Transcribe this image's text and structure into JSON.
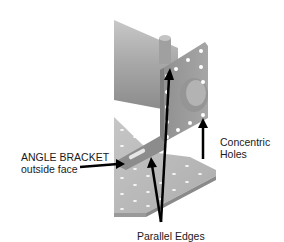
{
  "diagram": {
    "annotations": {
      "angle_bracket": {
        "line1": "ANGLE BRACKET",
        "line2": "outside face"
      },
      "concentric": {
        "line1": "Concentric",
        "line2": "Holes"
      },
      "parallel": {
        "text": "Parallel Edges"
      }
    },
    "colors": {
      "background": "#ffffff",
      "plate": "#b9b9b9",
      "plate_dark": "#8e8e8e",
      "bracket": "#9a9a9a",
      "cylinder": "#a8a8a8",
      "arrow": "#000000",
      "text": "#1a1a1a"
    }
  }
}
